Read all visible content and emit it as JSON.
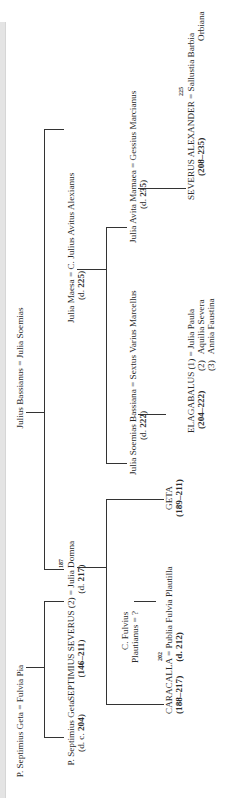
{
  "diagram": {
    "orientation": "rotated-90-ccw",
    "line_color": "#333333",
    "text_color": "#2a2a2a",
    "generation1": {
      "geta_couple": {
        "husband": "P. Septimius Geta",
        "sep": " = ",
        "wife": "Fulvia Pia"
      },
      "bassianus_couple": {
        "husband": "Julius Bassianus",
        "sep": " = ",
        "wife": "Julia Soemias"
      }
    },
    "generation2": {
      "p_geta": {
        "name": "P. Septimius Geta",
        "dates_prefix": "(d. c. ",
        "dates_year": "204",
        "dates_suffix": ")"
      },
      "severus": {
        "name": "SEPTIMIUS SEVERUS",
        "marriage_no": " (2) ",
        "sep": "= ",
        "wife": "Julia Domna",
        "marriage_year": "187",
        "reign_prefix": "(",
        "reign": "146–211",
        "reign_suffix": ")",
        "wife_dates_prefix": "(d. ",
        "wife_dates_year": "217",
        "wife_dates_suffix": ")"
      },
      "maesa": {
        "name": "Julia Maesa",
        "sep": " = ",
        "husband": "C. Julius Avitus Alexianus",
        "dates_prefix": "(d. ",
        "dates_year": "225",
        "dates_suffix": ")"
      }
    },
    "generation3": {
      "soemias": {
        "name": "Julia Soemias Bassiana",
        "sep": " = ",
        "husband": "Sextus Varius Marcellus",
        "dates_prefix": "(d. ",
        "dates_year": "222",
        "dates_suffix": ")"
      },
      "mamaea": {
        "name": "Julia Avita Mamaea",
        "sep": " = ",
        "husband": "Gessius Marcianus",
        "dates_prefix": "(d. ",
        "dates_year": "235",
        "dates_suffix": ")"
      },
      "plautianus": {
        "line1": "C. Fulvius",
        "line2": "Plautianus = ?"
      },
      "caracalla": {
        "name": "CARACALLA",
        "sep": " = ",
        "wife": "Publia Fulvia Plautilla",
        "marriage_year": "202",
        "reign": "(188–217)",
        "wife_dates": "(d. 212)"
      },
      "geta": {
        "name": "GETA",
        "reign": "(189–211)"
      }
    },
    "generation4": {
      "elagabalus": {
        "name": "ELAGABALUS",
        "reign": "(204–222)",
        "wives": [
          {
            "no": "(1)",
            "prefix": " = ",
            "name": "Julia Paula"
          },
          {
            "no": "(2)",
            "prefix": "",
            "name": "Aquilia Severa"
          },
          {
            "no": "(3)",
            "prefix": "",
            "name": "Annia Faustina"
          }
        ]
      },
      "severus_alexander": {
        "name": "SEVERUS ALEXANDER",
        "sep": " = ",
        "wife_line1": "Sallustia Barbia",
        "wife_line2": "Orbiana",
        "marriage_year": "225",
        "reign": "(208–235)"
      }
    }
  }
}
